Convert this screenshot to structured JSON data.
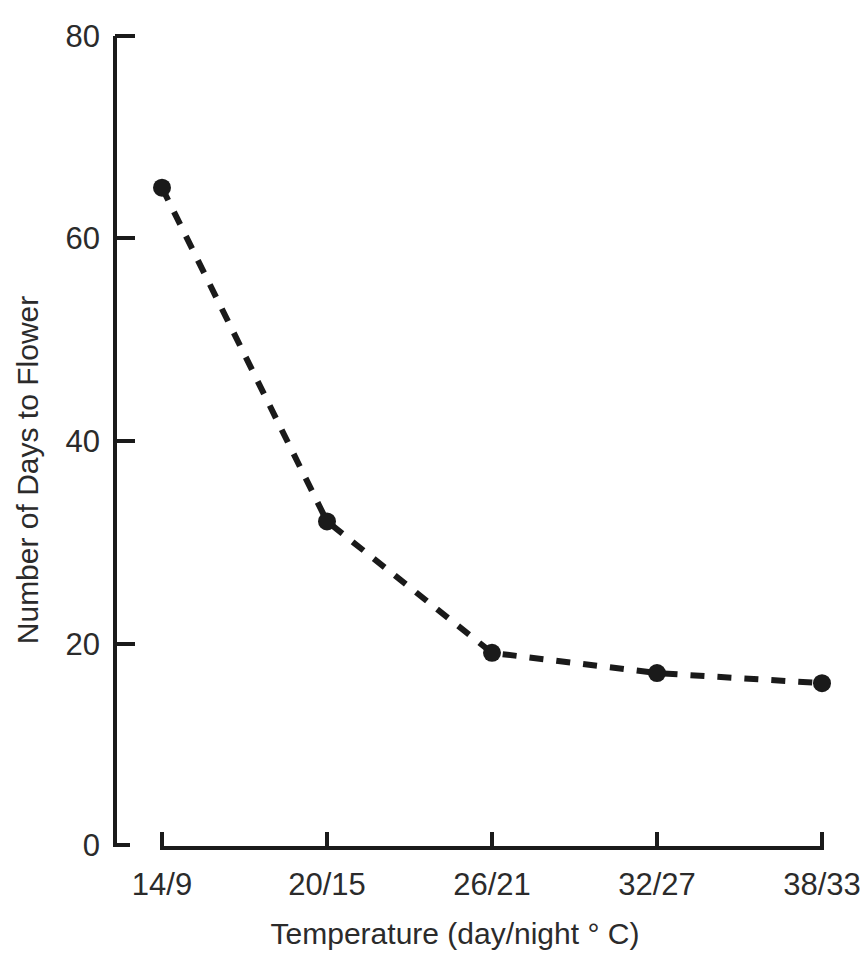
{
  "chart_data": {
    "type": "line",
    "title": "",
    "xlabel": "Temperature (day/night ° C)",
    "ylabel": "Number of Days to Flower",
    "categories": [
      "14/9",
      "20/15",
      "26/21",
      "32/27",
      "38/33"
    ],
    "values": [
      65,
      32,
      19,
      17,
      16
    ],
    "series": [
      {
        "name": "Days to Flower",
        "values": [
          65,
          32,
          19,
          17,
          16
        ]
      }
    ],
    "ylim": [
      0,
      80
    ],
    "yticks": [
      0,
      20,
      40,
      60,
      80
    ],
    "ytick_labels": [
      "0",
      "20",
      "40",
      "60",
      "80"
    ],
    "xtick_labels": [
      "14/9",
      "20/15",
      "26/21",
      "32/27",
      "38/33"
    ],
    "grid": false,
    "legend": "none",
    "line_style": "dashed",
    "marker": "filled-circle",
    "colors": {
      "line": "#1a1a1a",
      "marker": "#1a1a1a",
      "axis": "#1a1a1a",
      "text": "#2b2b2b",
      "background": "#ffffff"
    }
  },
  "axes": {
    "y_tick_0": "0",
    "y_tick_1": "20",
    "y_tick_2": "40",
    "y_tick_3": "60",
    "y_tick_4": "80",
    "x_tick_0": "14/9",
    "x_tick_1": "20/15",
    "x_tick_2": "26/21",
    "x_tick_3": "32/27",
    "x_tick_4": "38/33",
    "x_title": "Temperature (day/night ° C)",
    "y_title": "Number of Days to Flower"
  }
}
